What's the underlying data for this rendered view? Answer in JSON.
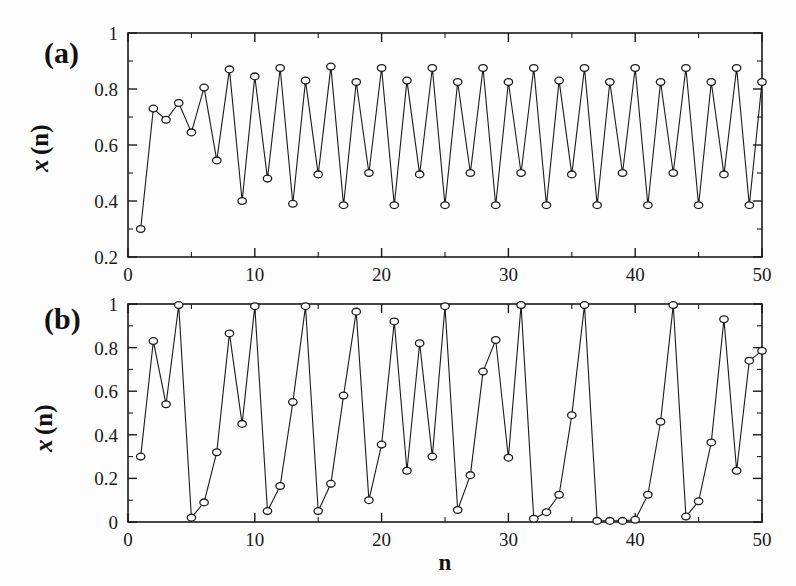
{
  "figure": {
    "background_color": "#fdfdfd",
    "line_color": "#1a1a1a",
    "marker_face_color": "#ffffff",
    "xlabel": "n",
    "panel_a_tag": "(a)",
    "panel_b_tag": "(b)",
    "ylabel_symbol": "x",
    "ylabel_arg": "(n)"
  },
  "chart_data": [
    {
      "type": "line",
      "panel": "(a)",
      "title": "",
      "xlabel": "n",
      "ylabel": "x(n)",
      "xlim": [
        0,
        50
      ],
      "ylim": [
        0.2,
        1.0
      ],
      "grid": false,
      "legend": null,
      "marker": "open-circle",
      "xticks": [
        0,
        10,
        20,
        30,
        40,
        50
      ],
      "xticklabels": [
        "0",
        "10",
        "20",
        "30",
        "40",
        "50"
      ],
      "xminor_step": 5,
      "yticks": [
        0.2,
        0.4,
        0.6,
        0.8,
        1.0
      ],
      "yticklabels": [
        "0.2",
        "0.4",
        "0.6",
        "0.8",
        "1"
      ],
      "yminor_step": 0.1,
      "x": [
        1,
        2,
        3,
        4,
        5,
        6,
        7,
        8,
        9,
        10,
        11,
        12,
        13,
        14,
        15,
        16,
        17,
        18,
        19,
        20,
        21,
        22,
        23,
        24,
        25,
        26,
        27,
        28,
        29,
        30,
        31,
        32,
        33,
        34,
        35,
        36,
        37,
        38,
        39,
        40,
        41,
        42,
        43,
        44,
        45,
        46,
        47,
        48,
        49,
        50
      ],
      "values": [
        0.3,
        0.73,
        0.69,
        0.75,
        0.645,
        0.805,
        0.545,
        0.87,
        0.4,
        0.845,
        0.48,
        0.875,
        0.39,
        0.83,
        0.495,
        0.88,
        0.385,
        0.825,
        0.5,
        0.875,
        0.385,
        0.83,
        0.495,
        0.875,
        0.385,
        0.825,
        0.5,
        0.875,
        0.385,
        0.825,
        0.5,
        0.875,
        0.385,
        0.83,
        0.495,
        0.875,
        0.385,
        0.825,
        0.5,
        0.875,
        0.385,
        0.825,
        0.5,
        0.875,
        0.385,
        0.825,
        0.495,
        0.875,
        0.385,
        0.825
      ]
    },
    {
      "type": "line",
      "panel": "(b)",
      "title": "",
      "xlabel": "n",
      "ylabel": "x(n)",
      "xlim": [
        0,
        50
      ],
      "ylim": [
        0.0,
        1.0
      ],
      "grid": false,
      "legend": null,
      "marker": "open-circle",
      "xticks": [
        0,
        10,
        20,
        30,
        40,
        50
      ],
      "xticklabels": [
        "0",
        "10",
        "20",
        "30",
        "40",
        "50"
      ],
      "xminor_step": 5,
      "yticks": [
        0.0,
        0.2,
        0.4,
        0.6,
        0.8,
        1.0
      ],
      "yticklabels": [
        "0",
        "0.2",
        "0.4",
        "0.6",
        "0.8",
        "1"
      ],
      "yminor_step": 0.1,
      "x": [
        1,
        2,
        3,
        4,
        5,
        6,
        7,
        8,
        9,
        10,
        11,
        12,
        13,
        14,
        15,
        16,
        17,
        18,
        19,
        20,
        21,
        22,
        23,
        24,
        25,
        26,
        27,
        28,
        29,
        30,
        31,
        32,
        33,
        34,
        35,
        36,
        37,
        38,
        39,
        40,
        41,
        42,
        43,
        44,
        45,
        46,
        47,
        48,
        49,
        50
      ],
      "values": [
        0.3,
        0.83,
        0.54,
        0.995,
        0.02,
        0.09,
        0.32,
        0.865,
        0.45,
        0.99,
        0.05,
        0.165,
        0.55,
        0.99,
        0.05,
        0.175,
        0.58,
        0.965,
        0.1,
        0.355,
        0.92,
        0.235,
        0.82,
        0.3,
        0.99,
        0.055,
        0.215,
        0.69,
        0.835,
        0.295,
        0.995,
        0.015,
        0.045,
        0.125,
        0.49,
        0.995,
        0.005,
        0.005,
        0.005,
        0.01,
        0.125,
        0.46,
        0.995,
        0.025,
        0.095,
        0.365,
        0.93,
        0.235,
        0.74,
        0.785
      ]
    }
  ]
}
